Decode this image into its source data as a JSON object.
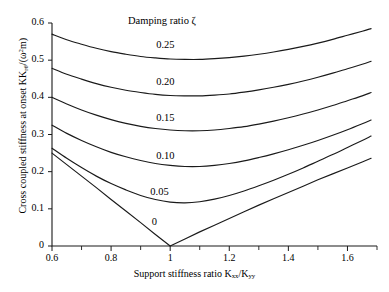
{
  "chart_data": {
    "type": "line",
    "title": "",
    "xlabel": "Support stiffness ratio Kxx/Kyy",
    "ylabel": "Cross coupled stiffness at onset Krθ̇/(ω²m)",
    "xlim": [
      0.6,
      1.7
    ],
    "ylim": [
      0,
      0.6
    ],
    "grid": false,
    "legend_title": "Damping ratio ζ",
    "legend_position": "inline-labels",
    "xticks": [
      0.6,
      0.8,
      1.0,
      1.2,
      1.4,
      1.6
    ],
    "xtick_labels": [
      "0.6",
      "0.8",
      "1",
      "1.2",
      "1.4",
      "1.6"
    ],
    "xminor_ticks": [
      0.7,
      0.9,
      1.1,
      1.3,
      1.5,
      1.7
    ],
    "yticks": [
      0,
      0.1,
      0.2,
      0.3,
      0.4,
      0.5,
      0.6
    ],
    "ytick_labels": [
      "0",
      "0.1",
      "0.2",
      "0.3",
      "0.4",
      "0.5",
      "0.6"
    ],
    "x": [
      0.6,
      0.65,
      0.7,
      0.75,
      0.8,
      0.85,
      0.9,
      0.95,
      1.0,
      1.05,
      1.1,
      1.15,
      1.2,
      1.25,
      1.3,
      1.35,
      1.4,
      1.45,
      1.5,
      1.55,
      1.6,
      1.65,
      1.68
    ],
    "series": [
      {
        "name": "0.25",
        "label": "0.25",
        "label_x": 1.0,
        "label_y": 0.535,
        "values": [
          0.57,
          0.555,
          0.543,
          0.532,
          0.523,
          0.516,
          0.51,
          0.506,
          0.503,
          0.502,
          0.502,
          0.504,
          0.507,
          0.511,
          0.516,
          0.522,
          0.529,
          0.537,
          0.546,
          0.556,
          0.567,
          0.578,
          0.585
        ]
      },
      {
        "name": "0.20",
        "label": "0.20",
        "label_x": 1.0,
        "label_y": 0.437,
        "values": [
          0.478,
          0.462,
          0.449,
          0.437,
          0.427,
          0.419,
          0.413,
          0.408,
          0.405,
          0.404,
          0.404,
          0.406,
          0.409,
          0.414,
          0.42,
          0.427,
          0.435,
          0.444,
          0.454,
          0.465,
          0.477,
          0.489,
          0.497
        ]
      },
      {
        "name": "0.15",
        "label": "0.15",
        "label_x": 1.0,
        "label_y": 0.338,
        "values": [
          0.4,
          0.382,
          0.366,
          0.352,
          0.34,
          0.33,
          0.322,
          0.316,
          0.312,
          0.31,
          0.31,
          0.312,
          0.316,
          0.321,
          0.328,
          0.336,
          0.345,
          0.355,
          0.366,
          0.378,
          0.391,
          0.404,
          0.413
        ]
      },
      {
        "name": "0.10",
        "label": "0.10",
        "label_x": 1.0,
        "label_y": 0.238,
        "values": [
          0.325,
          0.303,
          0.284,
          0.267,
          0.252,
          0.24,
          0.23,
          0.222,
          0.217,
          0.214,
          0.214,
          0.217,
          0.222,
          0.229,
          0.238,
          0.248,
          0.259,
          0.271,
          0.284,
          0.298,
          0.313,
          0.329,
          0.339
        ]
      },
      {
        "name": "0.05",
        "label": "0.05",
        "label_x": 0.98,
        "label_y": 0.14,
        "values": [
          0.263,
          0.236,
          0.211,
          0.188,
          0.168,
          0.151,
          0.136,
          0.125,
          0.118,
          0.116,
          0.119,
          0.126,
          0.136,
          0.148,
          0.162,
          0.177,
          0.193,
          0.21,
          0.228,
          0.246,
          0.265,
          0.284,
          0.296
        ]
      },
      {
        "name": "0",
        "label": "0",
        "label_x": 0.985,
        "label_y": 0.06,
        "values": [
          0.25,
          0.219,
          0.188,
          0.157,
          0.125,
          0.094,
          0.063,
          0.031,
          0.0,
          0.019,
          0.038,
          0.056,
          0.074,
          0.092,
          0.11,
          0.127,
          0.144,
          0.161,
          0.178,
          0.194,
          0.21,
          0.226,
          0.236
        ]
      }
    ]
  },
  "axis_text": {
    "xlabel_prefix": "Support stiffness ratio K",
    "xlabel_sub1": "xx",
    "xlabel_slash": "/K",
    "xlabel_sub2": "yy",
    "ylabel_prefix": "Cross coupled stiffness at onset K",
    "ylabel_sub1": "rθ̇",
    "ylabel_mid": "/(ω",
    "ylabel_sup": "2",
    "ylabel_suffix": "m)",
    "legend_title": "Damping ratio ζ"
  },
  "style": {
    "line_color": "#1a1a1a",
    "axis_color": "#1a1a1a",
    "background": "#ffffff"
  }
}
